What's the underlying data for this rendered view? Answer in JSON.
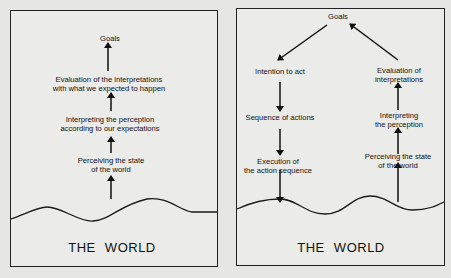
{
  "left_diagram": {
    "goals": "Goals",
    "evaluation": [
      "Evaluation of the interpretations",
      "with what we expected to happen"
    ],
    "interpreting": [
      "Interpreting the perception",
      "according to our expectations"
    ],
    "perceiving": [
      "Perceiving the state",
      "of the world"
    ],
    "world": "THE WORLD"
  },
  "right_diagram": {
    "goals": "Goals",
    "intention": "Intention to act",
    "sequence": "Sequence of actions",
    "execution": [
      "Execution of",
      "the action sequence"
    ],
    "evaluation": [
      "Evaluation of",
      "interpretations"
    ],
    "interpreting": [
      "Interpreting",
      "the perception"
    ],
    "perceiving": [
      "Perceiving the state",
      "of the world"
    ],
    "world": "THE WORLD"
  },
  "colors": {
    "background": "#e6e6e4",
    "panel": "#ebebe9",
    "ink": "#1a1a1a"
  }
}
